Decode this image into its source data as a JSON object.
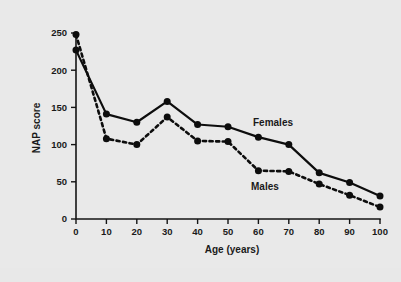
{
  "figure": {
    "background_color": "#e8e8e8",
    "ink_color": "#0d0d0d"
  },
  "chart_data": {
    "type": "line",
    "title": "",
    "xlabel": "Age (years)",
    "ylabel": "NAP score",
    "xlim": [
      0,
      100
    ],
    "ylim": [
      0,
      250
    ],
    "xticks": [
      0,
      10,
      20,
      30,
      40,
      50,
      60,
      70,
      80,
      90,
      100
    ],
    "xticklabels": [
      "0",
      "10",
      "20",
      "30",
      "40",
      "50",
      "60",
      "70",
      "80",
      "90",
      "100"
    ],
    "yticks": [
      0,
      50,
      100,
      150,
      200,
      250
    ],
    "yticklabels": [
      "0",
      "50",
      "100",
      "150",
      "200",
      "250"
    ],
    "grid": false,
    "legend_position": "inline-annotation",
    "x": [
      0,
      10,
      20,
      30,
      40,
      50,
      60,
      70,
      80,
      90,
      100
    ],
    "series": [
      {
        "name": "Females",
        "style": "solid",
        "marker": "filled-circle",
        "color": "#0d0d0d",
        "label_x": 72,
        "label_y": 133,
        "values": [
          227,
          141,
          130,
          158,
          127,
          124,
          110,
          100,
          62,
          49,
          31
        ]
      },
      {
        "name": "Males",
        "style": "dashed",
        "marker": "filled-circle",
        "color": "#0d0d0d",
        "label_x": 61,
        "label_y": 44,
        "values": [
          248,
          108,
          100,
          137,
          105,
          104,
          65,
          64,
          47,
          32,
          16
        ]
      }
    ]
  },
  "annotations": {
    "females_label": "Females",
    "males_label": "Males"
  }
}
